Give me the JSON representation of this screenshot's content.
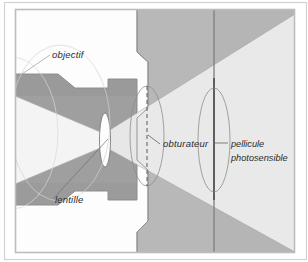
{
  "figure": {
    "kind": "technical-cross-section-diagram",
    "language": "fr",
    "canvas": {
      "width": 308,
      "height": 262
    },
    "background_color": "#ffffff",
    "frame": {
      "outer_border_color": "#c9c9c9",
      "inner_border_color": "#b9b9b9",
      "inner_rect": {
        "x": 14,
        "y": 8,
        "width": 282,
        "height": 246
      }
    },
    "palette": {
      "body_gray": "#b9b9b9",
      "body_gray_dark": "#a9a9a9",
      "barrel_gray": "#9b9b9b",
      "light_cone": "#f2f2f2",
      "light_cone_outer": "#e8e8e8",
      "lens_fill": "#fdfdfd",
      "film_line": "#7a7a7a",
      "outline": "#8a8a8a",
      "leader_line": "#6f6f6f",
      "text": "#2b2b2b"
    }
  },
  "labels": [
    {
      "id": "objectif",
      "text": "objectif",
      "x": 52,
      "y": 58,
      "anchor": "start",
      "leader": {
        "x1": 50,
        "y1": 55,
        "x2": 22,
        "y2": 74
      },
      "describes": "lens assembly / objective barrel"
    },
    {
      "id": "lentille",
      "text": "lentille",
      "x": 55,
      "y": 203,
      "anchor": "start",
      "leader": {
        "x1": 53,
        "y1": 199,
        "x2": 108,
        "y2": 139
      },
      "describes": "lens element"
    },
    {
      "id": "obturateur",
      "text": "obturateur",
      "x": 163,
      "y": 147,
      "anchor": "start",
      "leader": {
        "x1": 160,
        "y1": 144,
        "x2": 148,
        "y2": 136
      },
      "describes": "shutter"
    },
    {
      "id": "pellicule",
      "line1": "pellicule",
      "line2": "photosensible",
      "x": 231,
      "y": 147,
      "y2": 161,
      "anchor": "start",
      "leader": {
        "x1": 228,
        "y1": 143,
        "x2": 214,
        "y2": 143
      },
      "describes": "photosensitive film"
    }
  ],
  "components": {
    "lens_element": {
      "cx": 105,
      "cy": 140,
      "rx": 5.5,
      "ry": 27,
      "label_ref": "lentille"
    },
    "shutter": {
      "cx": 147,
      "cy": 136,
      "rx": 17,
      "ry": 50,
      "dashed_axis": true,
      "label_ref": "obturateur"
    },
    "film_plane": {
      "x": 214,
      "y_top": 10,
      "y_bottom": 252,
      "ellipse_rx": 16,
      "ellipse_ry": 52,
      "label_ref": "pellicule"
    },
    "light_cone_incoming": {
      "from": "left edge",
      "to": "lens",
      "direction": "converging"
    },
    "light_cone_outgoing": {
      "from": "lens",
      "to": "film plane",
      "direction": "diverging"
    }
  }
}
